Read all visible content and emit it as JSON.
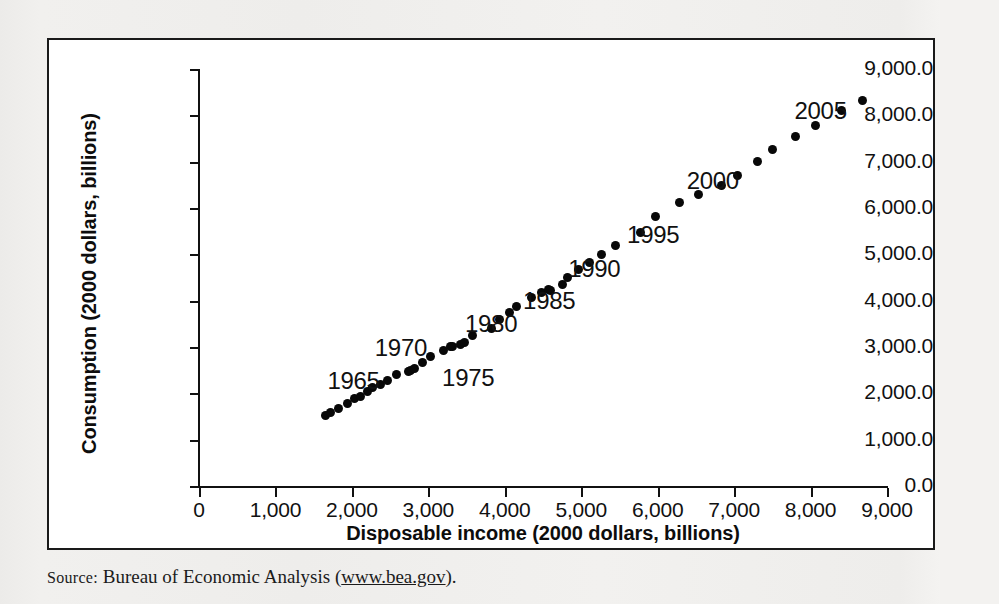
{
  "figure": {
    "background_color": "#ffffff",
    "frame_color": "#1a1a1a"
  },
  "source": {
    "label": "Source:",
    "text": " Bureau of Economic Analysis (",
    "url": "www.bea.gov",
    "suffix": ")."
  },
  "chart_data": {
    "type": "scatter",
    "title": "",
    "xlabel": "Disposable income (2000 dollars, billions)",
    "ylabel": "Consumption (2000 dollars, billions)",
    "xlim": [
      0,
      9000
    ],
    "ylim": [
      0,
      9000
    ],
    "grid": false,
    "legend": false,
    "marker_color": "#080808",
    "xticks": [
      0,
      1000,
      2000,
      3000,
      4000,
      5000,
      6000,
      7000,
      8000,
      9000
    ],
    "xticklabels": [
      "0",
      "1,000",
      "2,000",
      "3,000",
      "4,000",
      "5,000",
      "6,000",
      "7,000",
      "8,000",
      "9,000"
    ],
    "yticks": [
      0,
      1000,
      2000,
      3000,
      4000,
      5000,
      6000,
      7000,
      8000,
      9000
    ],
    "yticklabels": [
      "0.0",
      "1,000.0",
      "2,000.0",
      "3,000.0",
      "4,000.0",
      "5,000.0",
      "6,000.0",
      "7,000.0",
      "8,000.0",
      "9,000.0"
    ],
    "series": [
      {
        "name": "Consumption vs. disposable income",
        "points": [
          {
            "year": 1962,
            "x": 1660,
            "y": 1530
          },
          {
            "year": 1963,
            "x": 1720,
            "y": 1590
          },
          {
            "year": 1964,
            "x": 1830,
            "y": 1680
          },
          {
            "year": 1965,
            "x": 1940,
            "y": 1790
          },
          {
            "year": 1966,
            "x": 2030,
            "y": 1890
          },
          {
            "year": 1967,
            "x": 2110,
            "y": 1940
          },
          {
            "year": 1968,
            "x": 2200,
            "y": 2050
          },
          {
            "year": 1969,
            "x": 2270,
            "y": 2130
          },
          {
            "year": 1970,
            "x": 2370,
            "y": 2190
          },
          {
            "year": 1971,
            "x": 2470,
            "y": 2270
          },
          {
            "year": 1972,
            "x": 2580,
            "y": 2410
          },
          {
            "year": 1973,
            "x": 2770,
            "y": 2500
          },
          {
            "year": 1974,
            "x": 2740,
            "y": 2480
          },
          {
            "year": 1975,
            "x": 2820,
            "y": 2530
          },
          {
            "year": 1976,
            "x": 2920,
            "y": 2670
          },
          {
            "year": 1977,
            "x": 3030,
            "y": 2790
          },
          {
            "year": 1978,
            "x": 3200,
            "y": 2930
          },
          {
            "year": 1979,
            "x": 3290,
            "y": 3020
          },
          {
            "year": 1980,
            "x": 3310,
            "y": 3010
          },
          {
            "year": 1981,
            "x": 3420,
            "y": 3050
          },
          {
            "year": 1982,
            "x": 3470,
            "y": 3090
          },
          {
            "year": 1983,
            "x": 3580,
            "y": 3240
          },
          {
            "year": 1984,
            "x": 3820,
            "y": 3410
          },
          {
            "year": 1985,
            "x": 3930,
            "y": 3600
          },
          {
            "year": 1986,
            "x": 4060,
            "y": 3750
          },
          {
            "year": 1987,
            "x": 4150,
            "y": 3880
          },
          {
            "year": 1988,
            "x": 4350,
            "y": 4060
          },
          {
            "year": 1989,
            "x": 4480,
            "y": 4180
          },
          {
            "year": 1990,
            "x": 4570,
            "y": 4250
          },
          {
            "year": 1991,
            "x": 4600,
            "y": 4230
          },
          {
            "year": 1992,
            "x": 4750,
            "y": 4340
          },
          {
            "year": 1993,
            "x": 4820,
            "y": 4490
          },
          {
            "year": 1994,
            "x": 4970,
            "y": 4680
          },
          {
            "year": 1995,
            "x": 5110,
            "y": 4820
          },
          {
            "year": 1996,
            "x": 5260,
            "y": 4990
          },
          {
            "year": 1997,
            "x": 5450,
            "y": 5200
          },
          {
            "year": 1998,
            "x": 5770,
            "y": 5480
          },
          {
            "year": 1999,
            "x": 5970,
            "y": 5810
          },
          {
            "year": 2000,
            "x": 6280,
            "y": 6120
          },
          {
            "year": 2001,
            "x": 6540,
            "y": 6290
          },
          {
            "year": 2002,
            "x": 6830,
            "y": 6490
          },
          {
            "year": 2003,
            "x": 7040,
            "y": 6710
          },
          {
            "year": 2004,
            "x": 7300,
            "y": 7000
          },
          {
            "year": 2005,
            "x": 7500,
            "y": 7260
          },
          {
            "year": 2006,
            "x": 7800,
            "y": 7550
          },
          {
            "year": 2007,
            "x": 8060,
            "y": 7780
          },
          {
            "year": 2008,
            "x": 8400,
            "y": 8100
          },
          {
            "year": 2009,
            "x": 8680,
            "y": 8310
          }
        ]
      }
    ],
    "annotations": [
      {
        "text": "1965",
        "x": 1680,
        "y": 2230
      },
      {
        "text": "1970",
        "x": 2300,
        "y": 2930
      },
      {
        "text": "1975",
        "x": 3180,
        "y": 2290
      },
      {
        "text": "1980",
        "x": 3480,
        "y": 3450
      },
      {
        "text": "1985",
        "x": 4240,
        "y": 3960
      },
      {
        "text": "1990",
        "x": 4830,
        "y": 4650
      },
      {
        "text": "1995",
        "x": 5600,
        "y": 5370
      },
      {
        "text": "2000",
        "x": 6380,
        "y": 6550
      },
      {
        "text": "2005",
        "x": 7790,
        "y": 8040
      }
    ]
  }
}
